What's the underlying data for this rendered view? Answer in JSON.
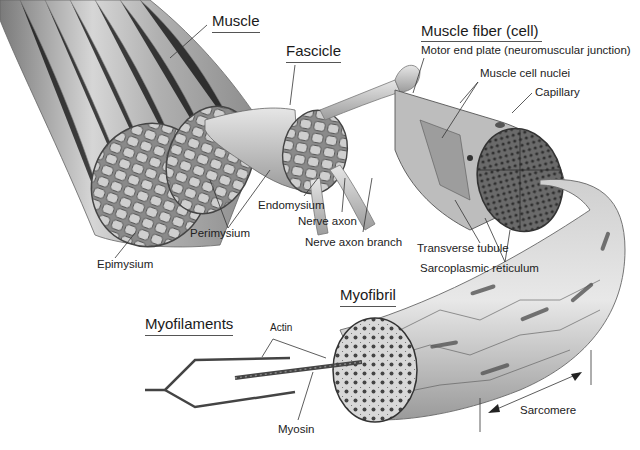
{
  "diagram": {
    "titles": {
      "muscle": "Muscle",
      "fascicle": "Fascicle",
      "muscle_fiber": "Muscle fiber (cell)",
      "myofibril": "Myofibril",
      "myofilaments": "Myofilaments"
    },
    "labels": {
      "motor_end_plate": "Motor end plate (neuromuscular junction)",
      "muscle_cell_nuclei": "Muscle cell nuclei",
      "capillary": "Capillary",
      "endomysium": "Endomysium",
      "nerve_axon": "Nerve axon",
      "nerve_axon_branch": "Nerve axon branch",
      "perimysium": "Perimysium",
      "epimysium": "Epimysium",
      "transverse_tubule": "Transverse tubule",
      "sarcoplasmic_reticulum": "Sarcoplasmic reticulum",
      "actin": "Actin",
      "myosin": "Myosin",
      "sarcomere": "Sarcomere"
    },
    "colors": {
      "ink": "#1a1a1a",
      "tissue_light": "#d9d9d9",
      "tissue_mid": "#a8a8a8",
      "tissue_dark": "#555555",
      "leader_line": "#333333"
    }
  }
}
